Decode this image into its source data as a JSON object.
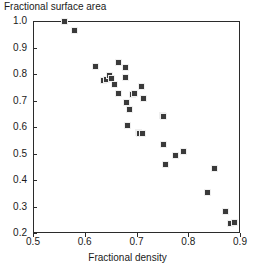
{
  "chart_data": {
    "type": "scatter",
    "title": "",
    "ylabel": "Fractional surface area",
    "xlabel": "Fractional density",
    "xlim": [
      0.5,
      0.9
    ],
    "ylim": [
      0.2,
      1.0
    ],
    "xticks": [
      "0.5",
      "0.6",
      "0.7",
      "0.8",
      "0.9"
    ],
    "xtick_values": [
      0.5,
      0.6,
      0.7,
      0.8,
      0.9
    ],
    "yticks": [
      "0.2",
      "0.3",
      "0.4",
      "0.5",
      "0.6",
      "0.7",
      "0.8",
      "0.9",
      "1.0"
    ],
    "ytick_values": [
      0.2,
      0.3,
      0.4,
      0.5,
      0.6,
      0.7,
      0.8,
      0.9,
      1.0
    ],
    "grid": false,
    "legend": null,
    "marker": "filled-square",
    "marker_color": "#3a3a3a",
    "series": [
      {
        "name": "samples",
        "points": [
          [
            0.561,
            1.0
          ],
          [
            0.58,
            0.966
          ],
          [
            0.62,
            0.83
          ],
          [
            0.636,
            0.774
          ],
          [
            0.641,
            0.78
          ],
          [
            0.648,
            0.793
          ],
          [
            0.652,
            0.782
          ],
          [
            0.657,
            0.762
          ],
          [
            0.666,
            0.845
          ],
          [
            0.666,
            0.727
          ],
          [
            0.678,
            0.826
          ],
          [
            0.679,
            0.786
          ],
          [
            0.681,
            0.694
          ],
          [
            0.683,
            0.605
          ],
          [
            0.686,
            0.667
          ],
          [
            0.693,
            0.722
          ],
          [
            0.697,
            0.726
          ],
          [
            0.703,
            0.578
          ],
          [
            0.706,
            0.577
          ],
          [
            0.709,
            0.753
          ],
          [
            0.712,
            0.576
          ],
          [
            0.714,
            0.706
          ],
          [
            0.75,
            0.642
          ],
          [
            0.752,
            0.638
          ],
          [
            0.752,
            0.534
          ],
          [
            0.756,
            0.46
          ],
          [
            0.775,
            0.494
          ],
          [
            0.791,
            0.509
          ],
          [
            0.838,
            0.354
          ],
          [
            0.851,
            0.444
          ],
          [
            0.872,
            0.28
          ],
          [
            0.881,
            0.236
          ],
          [
            0.89,
            0.24
          ]
        ]
      }
    ]
  }
}
